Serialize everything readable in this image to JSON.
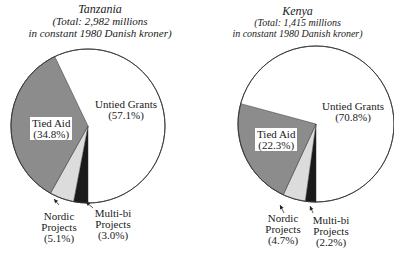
{
  "chart_data": [
    {
      "type": "pie",
      "title": "Tanzania",
      "subtitle_line1": "(Total: 2,982 millions",
      "subtitle_line2": "in constant 1980 Danish kroner)",
      "total": "2,982 millions in constant 1980 Danish kroner",
      "slices": [
        {
          "label": "Untied Grants",
          "value": 57.1,
          "display": "(57.1%)",
          "color": "#ffffff"
        },
        {
          "label": "Tied Aid",
          "value": 34.8,
          "display": "(34.8%)",
          "color": "#8c8c8c"
        },
        {
          "label": "Nordic Projects",
          "value": 5.1,
          "display": "(5.1%)",
          "color": "#dcdcdc",
          "line1": "Nordic",
          "line2": "Projects"
        },
        {
          "label": "Multi-bi Projects",
          "value": 3.0,
          "display": "(3.0%)",
          "color": "#1a1a1a",
          "line1": "Multi-bi",
          "line2": "Projects"
        }
      ]
    },
    {
      "type": "pie",
      "title": "Kenya",
      "subtitle_line1": "(Total: 1,415 millions",
      "subtitle_line2": "in constant 1980 Danish kroner)",
      "total": "1,415 millions in constant 1980 Danish kroner",
      "slices": [
        {
          "label": "Untied Grants",
          "value": 70.8,
          "display": "(70.8%)",
          "color": "#ffffff"
        },
        {
          "label": "Tied Aid",
          "value": 22.3,
          "display": "(22.3%)",
          "color": "#8c8c8c"
        },
        {
          "label": "Nordic Projects",
          "value": 4.7,
          "display": "(4.7%)",
          "color": "#dcdcdc",
          "line1": "Nordic",
          "line2": "Projects"
        },
        {
          "label": "Multi-bi Projects",
          "value": 2.2,
          "display": "(2.2%)",
          "color": "#1a1a1a",
          "line1": "Multi-bi",
          "line2": "Projects"
        }
      ]
    }
  ]
}
